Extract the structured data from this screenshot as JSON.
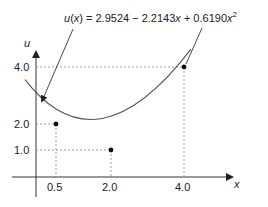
{
  "equation": {
    "lhs": "u(x) = ",
    "text": "2.9524 − 2.2143x + 0.6190x",
    "sup": "2",
    "full": "u(x) = 2.9524 − 2.2143x + 0.6190x²"
  },
  "axes": {
    "x_label": "x",
    "y_label": "u",
    "x_ticks": [
      "0.5",
      "2.0",
      "4.0"
    ],
    "y_ticks": [
      "1.0",
      "2.0",
      "4.0"
    ]
  },
  "points": [
    {
      "x": 0.5,
      "u": 2.0
    },
    {
      "x": 2.0,
      "u": 1.0
    },
    {
      "x": 4.0,
      "u": 4.0
    }
  ],
  "colors": {
    "curve": "#555555",
    "ink": "#222222",
    "guide": "#888888"
  }
}
